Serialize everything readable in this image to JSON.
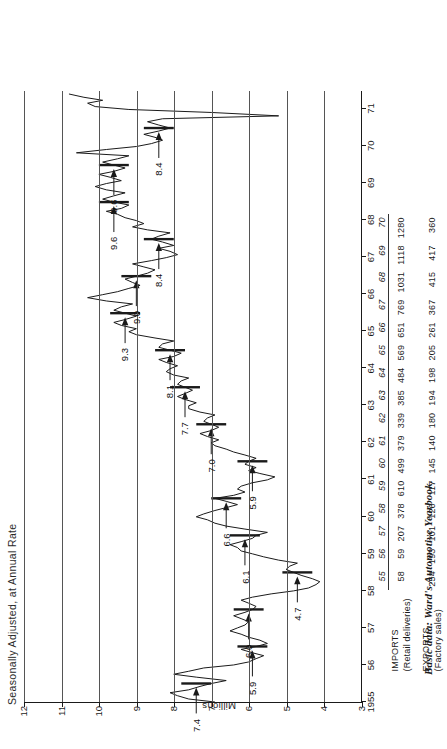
{
  "chart_data": {
    "type": "line",
    "title": "Seasonally Adjusted, at Annual Rate",
    "xlabel": "",
    "ylabel": "Millions",
    "ylim": [
      3,
      12
    ],
    "yticks": [
      12,
      11,
      10,
      9,
      8,
      7,
      6,
      5,
      4,
      3
    ],
    "grid": true,
    "legend_position": "none",
    "xlim": [
      1955,
      1971.5
    ],
    "xticks": [
      "1955",
      "56",
      "57",
      "58",
      "59",
      "60",
      "61",
      "62",
      "63",
      "64",
      "65",
      "66",
      "67",
      "68",
      "69",
      "70",
      "71"
    ],
    "annotations": [
      {
        "label": "7.4",
        "year": 1955.5,
        "value": 7.4
      },
      {
        "label": "5.9",
        "year": 1956.5,
        "value": 5.9
      },
      {
        "label": "6.0",
        "year": 1957.5,
        "value": 6.0
      },
      {
        "label": "4.7",
        "year": 1958.5,
        "value": 4.7
      },
      {
        "label": "6.1",
        "year": 1959.5,
        "value": 6.1
      },
      {
        "label": "6.6",
        "year": 1960.5,
        "value": 6.6
      },
      {
        "label": "5.9",
        "year": 1961.5,
        "value": 5.9
      },
      {
        "label": "7.0",
        "year": 1962.5,
        "value": 7.0
      },
      {
        "label": "7.7",
        "year": 1963.5,
        "value": 7.7
      },
      {
        "label": "8.1",
        "year": 1964.5,
        "value": 8.1
      },
      {
        "label": "9.3",
        "year": 1965.5,
        "value": 9.3
      },
      {
        "label": "9.0",
        "year": 1966.5,
        "value": 9.0
      },
      {
        "label": "8.4",
        "year": 1967.5,
        "value": 8.4
      },
      {
        "label": "9.6",
        "year": 1968.5,
        "value": 9.6
      },
      {
        "label": "9.6",
        "year": 1969.5,
        "value": 9.6
      },
      {
        "label": "8.4",
        "year": 1970.5,
        "value": 8.4
      }
    ],
    "year_average_bars": [
      {
        "year": 1955.5,
        "value": 7.4
      },
      {
        "year": 1956.5,
        "value": 5.9
      },
      {
        "year": 1957.5,
        "value": 6.0
      },
      {
        "year": 1958.5,
        "value": 4.7
      },
      {
        "year": 1959.5,
        "value": 6.1
      },
      {
        "year": 1960.5,
        "value": 6.6
      },
      {
        "year": 1961.5,
        "value": 5.9
      },
      {
        "year": 1962.5,
        "value": 7.0
      },
      {
        "year": 1963.5,
        "value": 7.7
      },
      {
        "year": 1964.5,
        "value": 8.1
      },
      {
        "year": 1965.5,
        "value": 9.3
      },
      {
        "year": 1966.5,
        "value": 9.0
      },
      {
        "year": 1967.5,
        "value": 8.4
      },
      {
        "year": 1968.5,
        "value": 9.6
      },
      {
        "year": 1969.5,
        "value": 9.6
      },
      {
        "year": 1970.5,
        "value": 8.4
      }
    ],
    "series": [
      {
        "name": "Seasonally adjusted annual rate",
        "x": [
          1955.0,
          1955.08,
          1955.17,
          1955.25,
          1955.33,
          1955.42,
          1955.5,
          1955.58,
          1955.67,
          1955.75,
          1955.83,
          1955.92,
          1956.0,
          1956.08,
          1956.17,
          1956.25,
          1956.33,
          1956.42,
          1956.5,
          1956.58,
          1956.67,
          1956.75,
          1956.83,
          1956.92,
          1957.0,
          1957.08,
          1957.17,
          1957.25,
          1957.33,
          1957.42,
          1957.5,
          1957.58,
          1957.67,
          1957.75,
          1957.83,
          1957.92,
          1958.0,
          1958.08,
          1958.17,
          1958.25,
          1958.33,
          1958.42,
          1958.5,
          1958.58,
          1958.67,
          1958.75,
          1958.83,
          1958.92,
          1959.0,
          1959.08,
          1959.17,
          1959.25,
          1959.33,
          1959.42,
          1959.5,
          1959.58,
          1959.67,
          1959.75,
          1959.83,
          1959.92,
          1960.0,
          1960.08,
          1960.17,
          1960.25,
          1960.33,
          1960.42,
          1960.5,
          1960.58,
          1960.67,
          1960.75,
          1960.83,
          1960.92,
          1961.0,
          1961.08,
          1961.17,
          1961.25,
          1961.33,
          1961.42,
          1961.5,
          1961.58,
          1961.67,
          1961.75,
          1961.83,
          1961.92,
          1962.0,
          1962.08,
          1962.17,
          1962.25,
          1962.33,
          1962.42,
          1962.5,
          1962.58,
          1962.67,
          1962.75,
          1962.83,
          1962.92,
          1963.0,
          1963.08,
          1963.17,
          1963.25,
          1963.33,
          1963.42,
          1963.5,
          1963.58,
          1963.67,
          1963.75,
          1963.83,
          1963.92,
          1964.0,
          1964.08,
          1964.17,
          1964.25,
          1964.33,
          1964.42,
          1964.5,
          1964.58,
          1964.67,
          1964.75,
          1964.83,
          1964.92,
          1965.0,
          1965.08,
          1965.17,
          1965.25,
          1965.33,
          1965.42,
          1965.5,
          1965.58,
          1965.67,
          1965.75,
          1965.83,
          1965.92,
          1966.0,
          1966.08,
          1966.17,
          1966.25,
          1966.33,
          1966.42,
          1966.5,
          1966.58,
          1966.67,
          1966.75,
          1966.83,
          1966.92,
          1967.0,
          1967.08,
          1967.17,
          1967.25,
          1967.33,
          1967.42,
          1967.5,
          1967.58,
          1967.67,
          1967.75,
          1967.83,
          1967.92,
          1968.0,
          1968.08,
          1968.17,
          1968.25,
          1968.33,
          1968.42,
          1968.5,
          1968.58,
          1968.67,
          1968.75,
          1968.83,
          1968.92,
          1969.0,
          1969.08,
          1969.17,
          1969.25,
          1969.33,
          1969.42,
          1969.5,
          1969.58,
          1969.67,
          1969.75,
          1969.83,
          1969.92,
          1970.0,
          1970.08,
          1970.17,
          1970.25,
          1970.33,
          1970.42,
          1970.5,
          1970.58,
          1970.67,
          1970.75,
          1970.83,
          1970.92,
          1971.0,
          1971.08,
          1971.17,
          1971.25,
          1971.33,
          1971.42
        ],
        "y": [
          6.9,
          7.6,
          7.9,
          8.1,
          7.6,
          7.3,
          7.0,
          6.6,
          7.4,
          8.0,
          7.6,
          7.2,
          6.4,
          6.0,
          5.8,
          5.6,
          5.9,
          6.2,
          5.8,
          5.5,
          5.7,
          6.0,
          6.2,
          6.5,
          6.3,
          6.1,
          6.0,
          6.2,
          6.4,
          6.1,
          5.9,
          5.8,
          6.0,
          6.2,
          5.9,
          5.4,
          4.8,
          4.4,
          4.2,
          4.1,
          4.3,
          4.6,
          4.8,
          5.0,
          4.9,
          4.7,
          5.2,
          5.6,
          5.9,
          6.2,
          6.3,
          6.5,
          6.2,
          5.9,
          5.8,
          5.5,
          6.1,
          6.6,
          6.9,
          7.1,
          7.4,
          7.2,
          6.9,
          6.6,
          6.3,
          6.6,
          6.9,
          6.4,
          6.1,
          6.3,
          6.2,
          5.9,
          5.5,
          5.3,
          5.7,
          6.0,
          5.8,
          6.1,
          6.0,
          5.8,
          6.1,
          6.4,
          6.6,
          6.9,
          7.0,
          6.8,
          7.1,
          7.3,
          7.0,
          6.8,
          7.0,
          7.2,
          7.1,
          6.9,
          7.3,
          7.6,
          7.6,
          7.4,
          7.7,
          7.9,
          7.7,
          7.5,
          7.7,
          7.9,
          7.8,
          7.6,
          8.0,
          8.2,
          8.1,
          7.9,
          8.2,
          8.4,
          8.0,
          7.8,
          8.1,
          8.4,
          8.3,
          8.0,
          8.5,
          9.0,
          9.2,
          9.0,
          9.4,
          9.6,
          9.3,
          9.0,
          9.3,
          9.6,
          9.4,
          9.1,
          9.8,
          10.3,
          9.9,
          9.5,
          9.2,
          8.9,
          9.1,
          9.3,
          9.0,
          8.7,
          8.5,
          8.8,
          9.1,
          8.6,
          8.2,
          7.9,
          8.1,
          8.4,
          8.0,
          8.3,
          8.6,
          8.4,
          8.1,
          8.7,
          9.1,
          8.8,
          9.0,
          9.3,
          9.5,
          9.8,
          9.4,
          9.2,
          9.6,
          9.9,
          9.6,
          9.3,
          9.8,
          10.1,
          9.8,
          9.4,
          9.7,
          10.0,
          9.6,
          9.3,
          9.6,
          9.9,
          9.5,
          9.2,
          10.6,
          9.8,
          9.0,
          8.6,
          8.3,
          8.5,
          8.8,
          8.4,
          8.1,
          8.4,
          8.7,
          8.3,
          5.2,
          7.0,
          9.2,
          10.1,
          10.3,
          9.9,
          10.4,
          10.8
        ]
      }
    ]
  },
  "table": {
    "row_labels": {
      "imports_title": "IMPORTS",
      "imports_sub": "(Retail deliveries)",
      "exports_title": "EXPORTS",
      "exports_sub": "(Factory sales)"
    },
    "years": [
      "55",
      "56",
      "57",
      "58",
      "59",
      "60",
      "61",
      "62",
      "63",
      "64",
      "65",
      "66",
      "67",
      "68",
      "69",
      "70"
    ],
    "imports": [
      "58",
      "59",
      "207",
      "378",
      "610",
      "499",
      "379",
      "339",
      "385",
      "484",
      "569",
      "651",
      "769",
      "1031",
      "1118",
      "1280"
    ],
    "exports": [
      "254",
      "193",
      "101",
      "126",
      "117",
      "145",
      "140",
      "180",
      "194",
      "198",
      "205",
      "261",
      "367",
      "415",
      "417",
      "360"
    ]
  },
  "caption": {
    "prefix": "Basic data:",
    "source": "Ward's Automotive Yearbook."
  },
  "colors": {
    "ink": "#1a1a1a",
    "grid": "#555555",
    "paper": "#ffffff"
  }
}
